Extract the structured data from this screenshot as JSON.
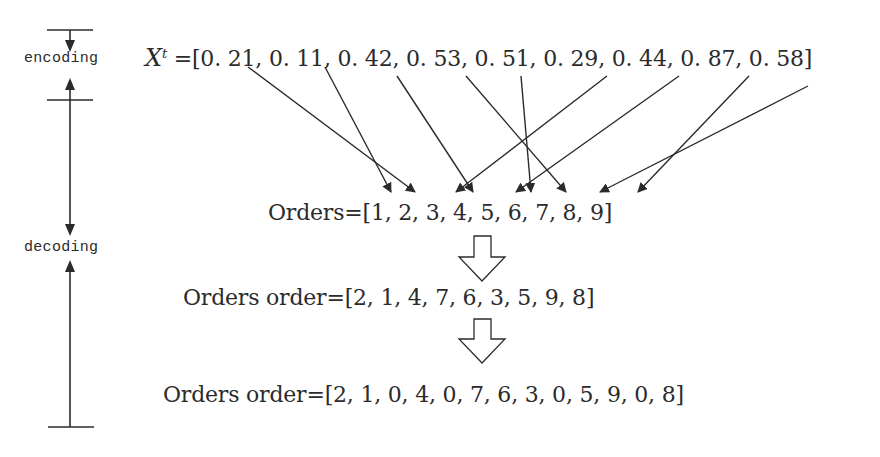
{
  "timeline": {
    "encoding_label": "encoding",
    "decoding_label": "decoding"
  },
  "rows": {
    "xt": {
      "var": "X",
      "sup": "t",
      "prefix": " =[",
      "values_text": "0. 21, 0. 11, 0. 42, 0. 53, 0. 51, 0. 29, 0. 44, 0. 87, 0. 58]",
      "values": [
        0.21,
        0.11,
        0.42,
        0.53,
        0.51,
        0.29,
        0.44,
        0.87,
        0.58
      ]
    },
    "orders": {
      "text": "Orders=[1, 2, 3, 4, 5, 6, 7, 8, 9]",
      "values": [
        1,
        2,
        3,
        4,
        5,
        6,
        7,
        8,
        9
      ]
    },
    "orders_order": {
      "text": "Orders order=[2, 1, 4, 7, 6, 3, 5, 9, 8]",
      "values": [
        2,
        1,
        4,
        7,
        6,
        3,
        5,
        9,
        8
      ]
    },
    "orders_order_padded": {
      "text": "Orders order=[2, 1, 0, 4, 0, 7, 6, 3, 0, 5, 9, 0, 8]",
      "values": [
        2,
        1,
        0,
        4,
        0,
        7,
        6,
        3,
        0,
        5,
        9,
        0,
        8
      ]
    }
  },
  "mapping_arrows": [
    {
      "from_value": 0.21,
      "to_order": 2
    },
    {
      "from_value": 0.11,
      "to_order": 1
    },
    {
      "from_value": 0.42,
      "to_order": 4
    },
    {
      "from_value": 0.53,
      "to_order": 7
    },
    {
      "from_value": 0.51,
      "to_order": 6
    },
    {
      "from_value": 0.29,
      "to_order": 3
    },
    {
      "from_value": 0.44,
      "to_order": 5
    },
    {
      "from_value": 0.87,
      "to_order": 9
    },
    {
      "from_value": 0.58,
      "to_order": 8
    }
  ],
  "colors": {
    "ink": "#2b2b2b",
    "background": "#ffffff"
  }
}
